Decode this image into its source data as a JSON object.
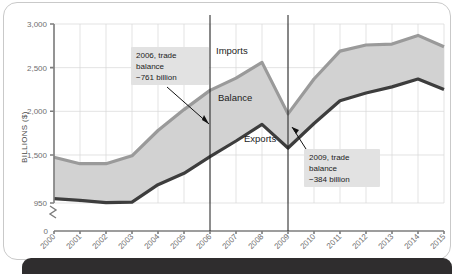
{
  "figure": {
    "background_color": "#ffffff",
    "card_border_color": "#c9c9c9",
    "bottom_bar_color": "#2f2d2e"
  },
  "chart_data": {
    "type": "area",
    "title": "",
    "subtitle": "",
    "xlabel": "",
    "ylabel": "BILLIONS ($)",
    "grid": true,
    "legend_position": "inline-labels",
    "axis_break": true,
    "axis_break_label": "0",
    "ylim": [
      950,
      3000
    ],
    "yticks": [
      950,
      1500,
      2000,
      2500,
      3000
    ],
    "ytick_labels": [
      "950",
      "1,500",
      "2,000",
      "2,500",
      "3,000"
    ],
    "categories": [
      "2000",
      "2001",
      "2002",
      "2003",
      "2004",
      "2005",
      "2006",
      "2007",
      "2008",
      "2009",
      "2010",
      "2011",
      "2012",
      "2013",
      "2014",
      "2015"
    ],
    "x": [
      2000,
      2001,
      2002,
      2003,
      2004,
      2005,
      2006,
      2007,
      2008,
      2009,
      2010,
      2011,
      2012,
      2013,
      2014,
      2015
    ],
    "series": [
      {
        "name": "Imports",
        "color": "#9a9a9a",
        "values": [
          1475,
          1400,
          1400,
          1490,
          1780,
          2020,
          2240,
          2380,
          2560,
          1970,
          2370,
          2690,
          2760,
          2770,
          2870,
          2740
        ]
      },
      {
        "name": "Exports",
        "color": "#3d3d3d",
        "values": [
          1000,
          980,
          955,
          960,
          1160,
          1290,
          1480,
          1660,
          1850,
          1580,
          1860,
          2120,
          2210,
          2280,
          2370,
          2250
        ]
      }
    ],
    "band": {
      "name": "Balance",
      "fill_color": "#d2d2d2",
      "description": "Shaded gap between Imports and Exports"
    },
    "series_labels": [
      {
        "id": "imports-label",
        "text": "Imports"
      },
      {
        "id": "balance-label",
        "text": "Balance"
      },
      {
        "id": "exports-label",
        "text": "Exports"
      }
    ],
    "event_lines": [
      {
        "id": "event-line-2006",
        "year": 2006
      },
      {
        "id": "event-line-2009",
        "year": 2009
      }
    ],
    "annotations": [
      {
        "id": "annotation-2006",
        "lines": [
          "2006, trade",
          "balance",
          "−761 billion"
        ],
        "year": 2006,
        "value": -761
      },
      {
        "id": "annotation-2009",
        "lines": [
          "2009, trade",
          "balance",
          "−384 billion"
        ],
        "year": 2009,
        "value": -384
      }
    ]
  }
}
